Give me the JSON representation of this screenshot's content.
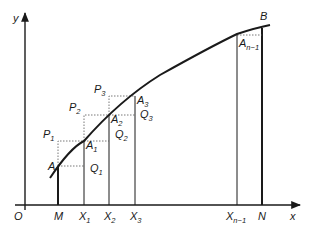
{
  "diagram": {
    "colors": {
      "line": "#1a1a1a",
      "dotted": "#555555",
      "background": "#ffffff"
    },
    "axes": {
      "origin_label": "O",
      "x_label": "x",
      "y_label": "y"
    },
    "x_ticks": [
      {
        "base": "M",
        "sub": ""
      },
      {
        "base": "X",
        "sub": "1"
      },
      {
        "base": "X",
        "sub": "2"
      },
      {
        "base": "X",
        "sub": "3"
      },
      {
        "base": "X",
        "sub": "n−1"
      },
      {
        "base": "N",
        "sub": ""
      }
    ],
    "curve_points": [
      {
        "base": "A",
        "sub": ""
      },
      {
        "base": "A",
        "sub": "1"
      },
      {
        "base": "A",
        "sub": "2"
      },
      {
        "base": "A",
        "sub": "3"
      },
      {
        "base": "A",
        "sub": "n−1"
      },
      {
        "base": "B",
        "sub": ""
      }
    ],
    "p_points": [
      {
        "base": "P",
        "sub": "1"
      },
      {
        "base": "P",
        "sub": "2"
      },
      {
        "base": "P",
        "sub": "3"
      }
    ],
    "q_points": [
      {
        "base": "Q",
        "sub": "1"
      },
      {
        "base": "Q",
        "sub": "2"
      },
      {
        "base": "Q",
        "sub": "3"
      }
    ]
  }
}
